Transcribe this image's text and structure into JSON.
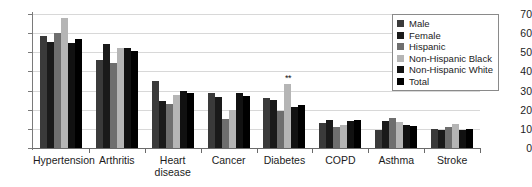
{
  "chart_data": {
    "type": "bar",
    "title": "",
    "subtitle": "",
    "xlabel": "",
    "ylabel": "",
    "ylim": [
      0,
      70
    ],
    "ytick_step": 10,
    "yticks": [
      0,
      10,
      20,
      30,
      40,
      50,
      60,
      70
    ],
    "grid": true,
    "legend_position": "top-right",
    "categories": [
      "Hypertension",
      "Arthritis",
      "Heart\ndisease",
      "Cancer",
      "Diabetes",
      "COPD",
      "Asthma",
      "Stroke"
    ],
    "series": [
      {
        "name": "Male",
        "color": "#3a3a3a",
        "values": [
          58.5,
          46.0,
          35.0,
          29.0,
          26.0,
          13.0,
          9.5,
          10.0
        ]
      },
      {
        "name": "Female",
        "color": "#1a1a1a",
        "values": [
          55.5,
          54.5,
          24.5,
          26.5,
          25.0,
          14.5,
          14.0,
          9.5
        ]
      },
      {
        "name": "Hispanic",
        "color": "#6e6e6e",
        "values": [
          60.0,
          44.5,
          23.0,
          15.0,
          19.5,
          11.0,
          15.5,
          11.0
        ]
      },
      {
        "name": "Non-Hispanic Black",
        "color": "#b5b5b5",
        "values": [
          68.0,
          52.0,
          27.5,
          20.0,
          33.5,
          12.0,
          13.5,
          12.5
        ]
      },
      {
        "name": "Non-Hispanic White",
        "color": "#111111",
        "values": [
          55.0,
          52.0,
          30.0,
          28.5,
          21.5,
          14.0,
          12.0,
          9.5
        ]
      },
      {
        "name": "Total",
        "color": "#000000",
        "values": [
          57.0,
          50.5,
          29.0,
          27.0,
          22.5,
          14.5,
          11.5,
          10.0
        ]
      }
    ],
    "annotations": [
      {
        "text": "**",
        "category": "Diabetes",
        "series": "Non-Hispanic Black",
        "value": 33.5
      }
    ]
  }
}
